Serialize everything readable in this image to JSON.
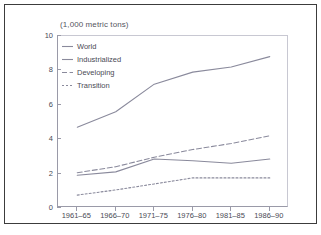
{
  "chart_data": {
    "type": "line",
    "title": "(1,000 metric tons)",
    "xlabel": "",
    "ylabel": "",
    "ylim": [
      0,
      10
    ],
    "yticks": [
      0,
      2,
      4,
      6,
      8,
      10
    ],
    "grid": false,
    "legend_position": "top-left-inside",
    "categories": [
      "1961–65",
      "1966–70",
      "1971–75",
      "1976–80",
      "1981–85",
      "1986–90"
    ],
    "series": [
      {
        "name": "World",
        "style": "solid",
        "color": "#8a8a9c",
        "values": [
          4.7,
          5.6,
          7.2,
          7.9,
          8.2,
          8.8
        ]
      },
      {
        "name": "Industrialized",
        "style": "solid",
        "color": "#8a8a9c",
        "values": [
          1.9,
          2.1,
          2.85,
          2.75,
          2.6,
          2.85
        ]
      },
      {
        "name": "Developing",
        "style": "dashed",
        "color": "#8a8a9c",
        "values": [
          2.05,
          2.4,
          2.95,
          3.4,
          3.75,
          4.2
        ]
      },
      {
        "name": "Transition",
        "style": "dotted",
        "color": "#8a8a9c",
        "values": [
          0.75,
          1.05,
          1.4,
          1.75,
          1.75,
          1.75
        ]
      }
    ]
  },
  "colors": {
    "line": "#8a8a9c",
    "axis": "#9a9aa8",
    "text": "#4a4a55",
    "frame": "#3c3c3c",
    "background": "#ffffff"
  }
}
